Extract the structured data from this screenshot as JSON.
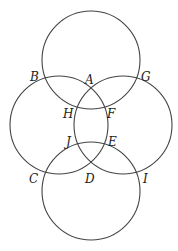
{
  "diagram": {
    "type": "four intersecting circles",
    "stroke_color": "#444444",
    "circles": [
      {
        "name": "top",
        "cx": 91,
        "cy": 60,
        "r": 49
      },
      {
        "name": "left",
        "cx": 59,
        "cy": 125,
        "r": 49
      },
      {
        "name": "right",
        "cx": 123,
        "cy": 125,
        "r": 49
      },
      {
        "name": "bottom",
        "cx": 91,
        "cy": 191,
        "r": 49
      }
    ],
    "labels": [
      {
        "text": "A",
        "x": 85,
        "y": 84
      },
      {
        "text": "B",
        "x": 30,
        "y": 81
      },
      {
        "text": "G",
        "x": 141,
        "y": 81
      },
      {
        "text": "H",
        "x": 63,
        "y": 118
      },
      {
        "text": "F",
        "x": 107,
        "y": 118
      },
      {
        "text": "J",
        "x": 66,
        "y": 146
      },
      {
        "text": "E",
        "x": 108,
        "y": 146
      },
      {
        "text": "C",
        "x": 29,
        "y": 183
      },
      {
        "text": "D",
        "x": 85,
        "y": 183
      },
      {
        "text": "I",
        "x": 143,
        "y": 183
      }
    ]
  }
}
